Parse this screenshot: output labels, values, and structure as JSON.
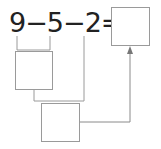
{
  "equation": {
    "terms": [
      "9",
      "−",
      "5",
      "−",
      "2",
      "="
    ]
  },
  "boxes": {
    "result": {
      "value": ""
    },
    "step1": {
      "value": ""
    },
    "step2": {
      "value": ""
    }
  },
  "colors": {
    "text": "#222222",
    "line": "#9a9a9a"
  }
}
